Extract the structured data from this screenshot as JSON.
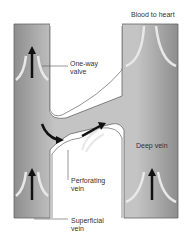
{
  "labels": {
    "blood_to_heart": "Blood to heart",
    "one_way_valve_1": "One-way",
    "one_way_valve_2": "valve",
    "deep_vein": "Deep vein",
    "perforating_vein_1": "Perforating",
    "perforating_vein_2": "vein",
    "superficial_vein_1": "Superficial",
    "superficial_vein_2": "vein"
  },
  "colors": {
    "vein_fill": "#b9b9b9",
    "vein_shade": "#8e8e8e",
    "valve": "#e6e6e6",
    "arrow": "#111111",
    "leader_line": "#555555"
  },
  "diagram": {
    "structures": [
      "superficial-vein",
      "perforating-vein",
      "deep-vein",
      "one-way-valves"
    ],
    "flow_arrows": [
      "superficial-up-top",
      "superficial-up-bottom",
      "deep-up",
      "perforating-flow-curve",
      "perforating-flow-straight"
    ]
  }
}
